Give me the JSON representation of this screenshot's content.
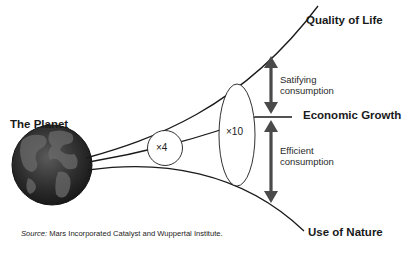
{
  "diagram": {
    "origin_label": "The Planet",
    "outcomes": {
      "top": "Quality of Life",
      "middle": "Economic Growth",
      "bottom": "Use of Nature"
    },
    "multipliers": {
      "small": "×4",
      "large": "×10"
    },
    "arrows": {
      "upper": {
        "line1": "Satifying",
        "line2": "consumption"
      },
      "lower": {
        "line1": "Efficient",
        "line2": "consumption"
      }
    },
    "source": {
      "prefix": "Source:",
      "text": " Mars Incorporated Catalyst and Wuppertal Institute."
    },
    "colors": {
      "line": "#1a1a1a",
      "arrow": "#4a4a4a",
      "globe_dark": "#1c1c1c",
      "globe_land": "#555555"
    }
  }
}
